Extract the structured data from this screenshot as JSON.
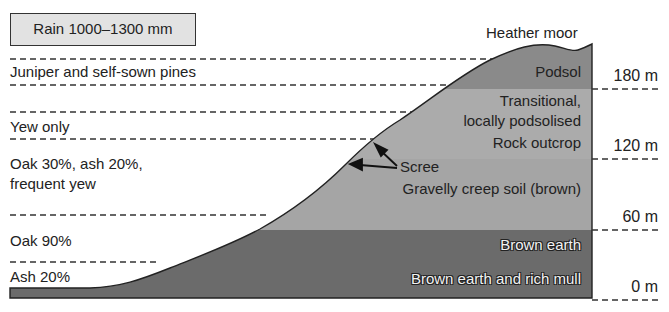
{
  "rain_box": {
    "label": "Rain 1000–1300 mm"
  },
  "top_label": "Heather moor",
  "vegetation_zones": [
    {
      "label": "Juniper and self-sown pines"
    },
    {
      "label": "Yew only"
    },
    {
      "label_line1": "Oak 30%, ash 20%,",
      "label_line2": "frequent yew"
    },
    {
      "label": "Oak 90%"
    },
    {
      "label": "Ash 20%"
    }
  ],
  "soil_zones": [
    {
      "label": "Podsol",
      "color": "#8a8a8a"
    },
    {
      "label_line1": "Transitional,",
      "label_line2": "locally podsolised",
      "label_line3": "Rock outcrop",
      "color": "#a9a9a9"
    },
    {
      "label": "Scree"
    },
    {
      "label": "Gravelly creep soil (brown)",
      "color": "#a6a6a6"
    },
    {
      "label": "Brown earth",
      "color": "#6b6b6b"
    },
    {
      "label": "Brown earth and rich mull",
      "color": "#6b6b6b"
    }
  ],
  "altitudes": [
    {
      "label": "180 m"
    },
    {
      "label": "120 m"
    },
    {
      "label": "60 m"
    },
    {
      "label": "0 m"
    }
  ]
}
